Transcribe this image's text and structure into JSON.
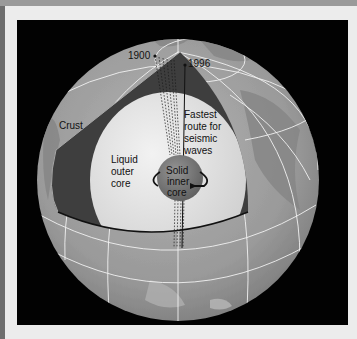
{
  "figure": {
    "labels": {
      "year_1900": "1900",
      "year_1996": "1996",
      "crust": "Crust",
      "outer_core_line1": "Liquid",
      "outer_core_line2": "outer",
      "outer_core_line3": "core",
      "inner_core_line1": "Solid",
      "inner_core_line2": "inner",
      "inner_core_line3": "core",
      "route_line1": "Fastest",
      "route_line2": "route for",
      "route_line3": "seismic",
      "route_line4": "waves"
    },
    "colors": {
      "background": "#020202",
      "globe_surface": "#9c9c9c",
      "mantle": "#3e3e3e",
      "outer_core": "#e2e2e2",
      "inner_core": "#7a7a7a",
      "gridlines": "#f2f2f2"
    }
  }
}
